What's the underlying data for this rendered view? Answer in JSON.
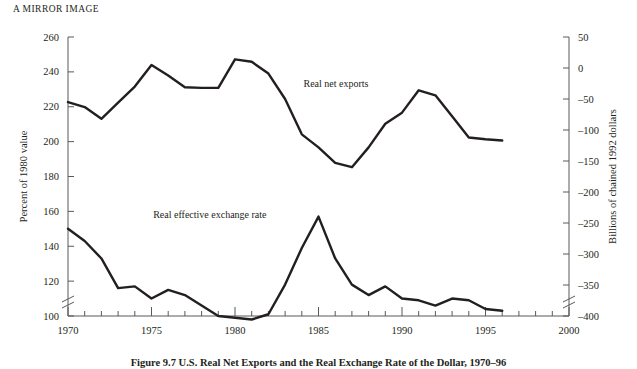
{
  "figure": {
    "title": "A MIRROR IMAGE",
    "caption": "Figure 9.7    U.S. Real Net Exports and the Real Exchange Rate of the Dollar, 1970–96"
  },
  "chart_data": {
    "type": "line",
    "title": "A MIRROR IMAGE",
    "xlabel": "",
    "xlim": [
      1970,
      2000
    ],
    "grid": false,
    "legend": "inline-labels",
    "x_ticks_major": [
      "1970",
      "1975",
      "1980",
      "1985",
      "1990",
      "1995",
      "2000"
    ],
    "x_ticks_minor_interval": 1,
    "axes": [
      {
        "id": "left",
        "ylabel": "Percent of 1980 value",
        "ylim": [
          100,
          260
        ],
        "ytick_step": 20,
        "ytick_labels": [
          "260",
          "240",
          "220",
          "200",
          "180",
          "160",
          "140",
          "120",
          "100"
        ],
        "axis_break": true
      },
      {
        "id": "right",
        "ylabel": "Billions of chained 1992 dollars",
        "ylim": [
          -400,
          50
        ],
        "ytick_step": 50,
        "ytick_labels": [
          "50",
          "0",
          "–50",
          "–100",
          "–150",
          "–200",
          "–250",
          "–300",
          "–350",
          "–400"
        ],
        "axis_break": true
      }
    ],
    "series": [
      {
        "name": "Real net exports",
        "label": "Real net exports",
        "axis": "right",
        "label_x": 1984.1,
        "label_y": -30,
        "x": [
          1970,
          1971,
          1972,
          1973,
          1974,
          1975,
          1976,
          1977,
          1978,
          1979,
          1980,
          1981,
          1982,
          1983,
          1984,
          1985,
          1986,
          1987,
          1988,
          1989,
          1990,
          1991,
          1992,
          1993,
          1994,
          1995,
          1996
        ],
        "values": [
          -55,
          -63,
          -82,
          -56,
          -30,
          5,
          -12,
          -31,
          -32,
          -32,
          14,
          10,
          -9,
          -50,
          -107,
          -128,
          -153,
          -160,
          -128,
          -90,
          -72,
          -36,
          -44,
          -78,
          -112,
          -115,
          -117
        ]
      },
      {
        "name": "Real effective exchange rate",
        "label": "Real effective exchange rate",
        "axis": "left",
        "label_x": 1975.1,
        "label_y": 156,
        "x": [
          1970,
          1971,
          1972,
          1973,
          1974,
          1975,
          1976,
          1977,
          1978,
          1979,
          1980,
          1981,
          1982,
          1983,
          1984,
          1985,
          1986,
          1987,
          1988,
          1989,
          1990,
          1991,
          1992,
          1993,
          1994,
          1995,
          1996
        ],
        "values": [
          150,
          143,
          133,
          116,
          117,
          110,
          115,
          112,
          106,
          100,
          99,
          98,
          101,
          118,
          139,
          157,
          133,
          118,
          112,
          117,
          110,
          109,
          106,
          110,
          109,
          104,
          103
        ]
      }
    ]
  }
}
